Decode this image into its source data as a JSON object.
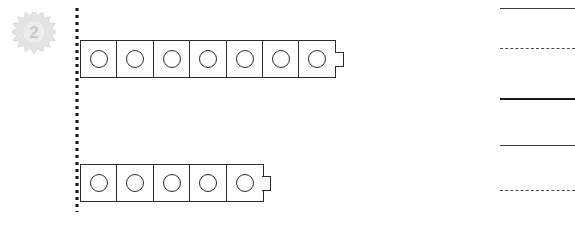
{
  "page": {
    "width": 575,
    "height": 230,
    "background": "#ffffff"
  },
  "badge": {
    "label": "2",
    "icon": "sunburst-star-icon",
    "fill_color": "#e2e2e2",
    "text_color": "#c9c9c9"
  },
  "guide_line": {
    "orientation": "vertical",
    "style": "dotted",
    "color": "#1a1a1a",
    "dot_size": 3,
    "dot_gap": 4
  },
  "cube_trains": [
    {
      "name": "top-train",
      "count": 7,
      "cube_mark": "circle",
      "has_connector_nub": true
    },
    {
      "name": "bottom-train",
      "count": 5,
      "cube_mark": "circle",
      "has_connector_nub": true
    }
  ],
  "answer_lines": [
    {
      "name": "answer-line-1",
      "style": "solid-thin",
      "y": 8
    },
    {
      "name": "answer-line-2",
      "style": "dashed-thin",
      "y": 48
    },
    {
      "name": "answer-line-3",
      "style": "solid-thick",
      "y": 98
    },
    {
      "name": "answer-line-4",
      "style": "solid-thin",
      "y": 145
    },
    {
      "name": "answer-line-5",
      "style": "dashed-thin",
      "y": 190
    }
  ],
  "colors": {
    "ink": "#2b2b2b",
    "ink_dark": "#1a1a1a",
    "badge_gray": "#e2e2e2",
    "paper": "#ffffff"
  }
}
